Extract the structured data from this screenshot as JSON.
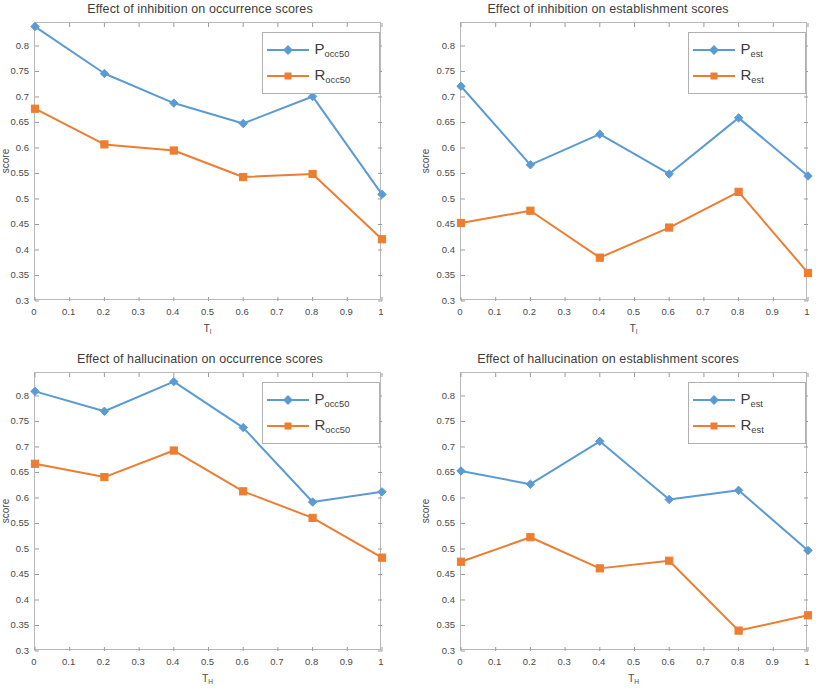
{
  "figure": {
    "background": "#ffffff",
    "series_colors": {
      "blue": "#5b9bd5",
      "orange": "#ed7d31"
    }
  },
  "panels": [
    {
      "id": "top-left",
      "title": "Effect of inhibition on occurrence scores",
      "xlabel_main": "T",
      "xlabel_sub": "I",
      "ylabel": "score",
      "clipped_right": false,
      "legend": [
        {
          "main": "P",
          "sub": "occ50",
          "color": "#5b9bd5",
          "marker": "diamond"
        },
        {
          "main": "R",
          "sub": "occ50",
          "color": "#ed7d31",
          "marker": "square"
        }
      ]
    },
    {
      "id": "top-right",
      "title": "Effect of inhibition on establishment scores",
      "xlabel_main": "T",
      "xlabel_sub": "I",
      "ylabel": "score",
      "clipped_right": true,
      "legend": [
        {
          "main": "P",
          "sub": "est",
          "color": "#5b9bd5",
          "marker": "diamond"
        },
        {
          "main": "R",
          "sub": "est",
          "color": "#ed7d31",
          "marker": "square"
        }
      ]
    },
    {
      "id": "bottom-left",
      "title": "Effect of hallucination on occurrence scores",
      "xlabel_main": "T",
      "xlabel_sub": "H",
      "ylabel": "score",
      "clipped_right": false,
      "legend": [
        {
          "main": "P",
          "sub": "occ50",
          "color": "#5b9bd5",
          "marker": "diamond"
        },
        {
          "main": "R",
          "sub": "occ50",
          "color": "#ed7d31",
          "marker": "square"
        }
      ]
    },
    {
      "id": "bottom-right",
      "title": "Effect of hallucination on establishment scores",
      "xlabel_main": "T",
      "xlabel_sub": "H",
      "ylabel": "score",
      "clipped_right": true,
      "legend": [
        {
          "main": "P",
          "sub": "est",
          "color": "#5b9bd5",
          "marker": "diamond"
        },
        {
          "main": "R",
          "sub": "est",
          "color": "#ed7d31",
          "marker": "square"
        }
      ]
    }
  ],
  "chart_data": [
    {
      "type": "line",
      "panel": "top-left",
      "title": "Effect of inhibition on occurrence scores",
      "xlabel": "T_I",
      "ylabel": "score",
      "x": [
        0,
        0.2,
        0.4,
        0.6,
        0.8,
        1
      ],
      "xlim": [
        0,
        1
      ],
      "ylim": [
        0.3,
        0.845
      ],
      "xticks": [
        0,
        0.1,
        0.2,
        0.3,
        0.4,
        0.5,
        0.6,
        0.7,
        0.8,
        0.9,
        1
      ],
      "xticklabels": [
        "0",
        "0.1",
        "0.2",
        "0.3",
        "0.4",
        "0.5",
        "0.6",
        "0.7",
        "0.8",
        "0.9",
        "1"
      ],
      "yticks": [
        0.3,
        0.35,
        0.4,
        0.45,
        0.5,
        0.55,
        0.6,
        0.65,
        0.7,
        0.75,
        0.8
      ],
      "yticklabels": [
        "0.3",
        "0.35",
        "0.4",
        "0.45",
        "0.5",
        "0.55",
        "0.6",
        "0.65",
        "0.7",
        "0.75",
        "0.8"
      ],
      "grid": false,
      "legend_position": "upper right",
      "series": [
        {
          "name": "P_occ50",
          "color": "#5b9bd5",
          "marker": "diamond",
          "values": [
            0.838,
            0.746,
            0.688,
            0.648,
            0.701,
            0.509
          ]
        },
        {
          "name": "R_occ50",
          "color": "#ed7d31",
          "marker": "square",
          "values": [
            0.677,
            0.607,
            0.595,
            0.543,
            0.549,
            0.421
          ]
        }
      ]
    },
    {
      "type": "line",
      "panel": "top-right",
      "title": "Effect of inhibition on establishment scores",
      "xlabel": "T_I",
      "ylabel": "score",
      "x": [
        0,
        0.2,
        0.4,
        0.6,
        0.8,
        1
      ],
      "xlim": [
        0,
        1
      ],
      "ylim": [
        0.3,
        0.845
      ],
      "xticks": [
        0,
        0.1,
        0.2,
        0.3,
        0.4,
        0.5,
        0.6,
        0.7,
        0.8,
        0.9,
        1
      ],
      "xticklabels": [
        "0",
        "0.1",
        "0.2",
        "0.3",
        "0.4",
        "0.5",
        "0.6",
        "0.7",
        "0.8",
        "0.9",
        "1"
      ],
      "yticks": [
        0.3,
        0.35,
        0.4,
        0.45,
        0.5,
        0.55,
        0.6,
        0.65,
        0.7,
        0.75,
        0.8
      ],
      "yticklabels": [
        "0.3",
        "0.35",
        "0.4",
        "0.45",
        "0.5",
        "0.55",
        "0.6",
        "0.65",
        "0.7",
        "0.75",
        "0.8"
      ],
      "grid": false,
      "legend_position": "upper right",
      "note": "right edge of panel is cropped by the screenshot frame",
      "series": [
        {
          "name": "P_est",
          "color": "#5b9bd5",
          "marker": "diamond",
          "values": [
            0.721,
            0.567,
            0.627,
            0.549,
            0.659,
            0.545
          ]
        },
        {
          "name": "R_est",
          "color": "#ed7d31",
          "marker": "square",
          "values": [
            0.453,
            0.477,
            0.385,
            0.444,
            0.514,
            0.355
          ]
        }
      ]
    },
    {
      "type": "line",
      "panel": "bottom-left",
      "title": "Effect of hallucination on occurrence scores",
      "xlabel": "T_H",
      "ylabel": "score",
      "x": [
        0,
        0.2,
        0.4,
        0.6,
        0.8,
        1
      ],
      "xlim": [
        0,
        1
      ],
      "ylim": [
        0.3,
        0.845
      ],
      "xticks": [
        0,
        0.1,
        0.2,
        0.3,
        0.4,
        0.5,
        0.6,
        0.7,
        0.8,
        0.9,
        1
      ],
      "xticklabels": [
        "0",
        "0.1",
        "0.2",
        "0.3",
        "0.4",
        "0.5",
        "0.6",
        "0.7",
        "0.8",
        "0.9",
        "1"
      ],
      "yticks": [
        0.3,
        0.35,
        0.4,
        0.45,
        0.5,
        0.55,
        0.6,
        0.65,
        0.7,
        0.75,
        0.8
      ],
      "yticklabels": [
        "0.3",
        "0.35",
        "0.4",
        "0.45",
        "0.5",
        "0.55",
        "0.6",
        "0.65",
        "0.7",
        "0.75",
        "0.8"
      ],
      "grid": false,
      "legend_position": "upper right",
      "series": [
        {
          "name": "P_occ50",
          "color": "#5b9bd5",
          "marker": "diamond",
          "values": [
            0.809,
            0.77,
            0.828,
            0.738,
            0.592,
            0.612
          ]
        },
        {
          "name": "R_occ50",
          "color": "#ed7d31",
          "marker": "square",
          "values": [
            0.667,
            0.641,
            0.693,
            0.613,
            0.561,
            0.483
          ]
        }
      ]
    },
    {
      "type": "line",
      "panel": "bottom-right",
      "title": "Effect of hallucination on establishment scores",
      "xlabel": "T_H",
      "ylabel": "score",
      "x": [
        0,
        0.2,
        0.4,
        0.6,
        0.8,
        1
      ],
      "xlim": [
        0,
        1
      ],
      "ylim": [
        0.3,
        0.845
      ],
      "xticks": [
        0,
        0.1,
        0.2,
        0.3,
        0.4,
        0.5,
        0.6,
        0.7,
        0.8,
        0.9,
        1
      ],
      "xticklabels": [
        "0",
        "0.1",
        "0.2",
        "0.3",
        "0.4",
        "0.5",
        "0.6",
        "0.7",
        "0.8",
        "0.9",
        "1"
      ],
      "yticks": [
        0.3,
        0.35,
        0.4,
        0.45,
        0.5,
        0.55,
        0.6,
        0.65,
        0.7,
        0.75,
        0.8
      ],
      "yticklabels": [
        "0.3",
        "0.35",
        "0.4",
        "0.45",
        "0.5",
        "0.55",
        "0.6",
        "0.65",
        "0.7",
        "0.75",
        "0.8"
      ],
      "grid": false,
      "legend_position": "upper right",
      "note": "right edge of panel is cropped by the screenshot frame",
      "series": [
        {
          "name": "P_est",
          "color": "#5b9bd5",
          "marker": "diamond",
          "values": [
            0.653,
            0.627,
            0.711,
            0.597,
            0.615,
            0.497
          ]
        },
        {
          "name": "R_est",
          "color": "#ed7d31",
          "marker": "square",
          "values": [
            0.475,
            0.523,
            0.462,
            0.477,
            0.34,
            0.37
          ]
        }
      ]
    }
  ]
}
